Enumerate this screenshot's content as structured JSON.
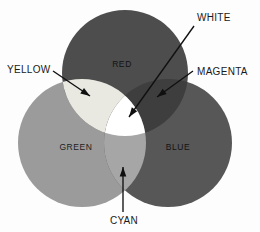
{
  "diagram": {
    "background_color": "#fdfdfd",
    "width": 260,
    "height": 232
  },
  "circles": [
    {
      "id": "red",
      "label": "RED",
      "color": "#4d4d4d",
      "cx": 125,
      "cy": 73,
      "r": 63,
      "label_x": 122,
      "label_y": 67
    },
    {
      "id": "green",
      "label": "GREEN",
      "color": "#9b9b9b",
      "cx": 82,
      "cy": 143,
      "r": 64,
      "label_x": 76,
      "label_y": 150
    },
    {
      "id": "blue",
      "label": "BLUE",
      "color": "#575757",
      "cx": 168,
      "cy": 143,
      "r": 64,
      "label_x": 178,
      "label_y": 150
    }
  ],
  "intersections": [
    {
      "id": "yellow",
      "label": "YELLOW",
      "description": "red and green overlap",
      "color": "#e9e9e2"
    },
    {
      "id": "magenta",
      "label": "MAGENTA",
      "description": "red and blue overlap",
      "color": "#3e3e3e"
    },
    {
      "id": "cyan",
      "label": "CYAN",
      "description": "green and blue overlap",
      "color": "#a6a6a6"
    },
    {
      "id": "white",
      "label": "WHITE",
      "description": "all three overlap",
      "color": "#ffffff"
    }
  ],
  "callouts": [
    {
      "id": "white",
      "label": "WHITE",
      "text_x": 197,
      "text_y": 21,
      "anchor": "start",
      "line_x1": 194,
      "line_y1": 26,
      "line_x2": 129,
      "line_y2": 117
    },
    {
      "id": "yellow",
      "label": "YELLOW",
      "text_x": 7,
      "text_y": 73,
      "anchor": "start",
      "line_x1": 53,
      "line_y1": 71,
      "line_x2": 90,
      "line_y2": 96
    },
    {
      "id": "magenta",
      "label": "MAGENTA",
      "text_x": 197,
      "text_y": 75,
      "anchor": "start",
      "line_x1": 193,
      "line_y1": 71,
      "line_x2": 157,
      "line_y2": 97
    },
    {
      "id": "cyan",
      "label": "CYAN",
      "text_x": 124,
      "text_y": 224,
      "anchor": "middle",
      "line_x1": 123,
      "line_y1": 212,
      "line_x2": 123,
      "line_y2": 167
    }
  ]
}
